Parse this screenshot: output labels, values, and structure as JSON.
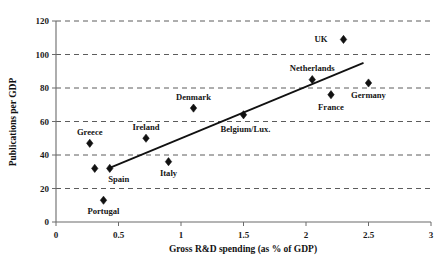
{
  "chart_data": {
    "type": "scatter",
    "title": "",
    "xlabel": "Gross R&D spending (as % of GDP)",
    "ylabel": "Publications per GDP",
    "xlim": [
      0,
      3
    ],
    "ylim": [
      0,
      120
    ],
    "xticks": [
      "0",
      "0.5",
      "1",
      "1.5",
      "2",
      "2.5",
      "3"
    ],
    "xtick_values": [
      0,
      0.5,
      1,
      1.5,
      2,
      2.5,
      3
    ],
    "yticks": [
      "0",
      "20",
      "40",
      "60",
      "80",
      "100",
      "120"
    ],
    "ytick_values": [
      0,
      20,
      40,
      60,
      80,
      100,
      120
    ],
    "grid": "horizontal-dashed",
    "legend": "none",
    "marker_shape": "diamond",
    "marker_color": "#111111",
    "points": [
      {
        "label": "Portugal",
        "x": 0.38,
        "y": 13,
        "label_dx": 0,
        "label_dy": 14,
        "anchor": "middle"
      },
      {
        "label": "Greece",
        "x": 0.27,
        "y": 47,
        "label_dx": 0,
        "label_dy": -8,
        "anchor": "middle"
      },
      {
        "label": "Spain",
        "x": 0.43,
        "y": 32,
        "label_dx": 9,
        "label_dy": 14,
        "anchor": "middle"
      },
      {
        "label": "Ireland",
        "x": 0.72,
        "y": 50,
        "label_dx": 0,
        "label_dy": -8,
        "anchor": "middle"
      },
      {
        "label": "Italy",
        "x": 0.9,
        "y": 36,
        "label_dx": 0,
        "label_dy": 14,
        "anchor": "middle"
      },
      {
        "label": "Denmark",
        "x": 1.1,
        "y": 68,
        "label_dx": 0,
        "label_dy": -8,
        "anchor": "middle"
      },
      {
        "label": "Belgium/Lux.",
        "x": 1.5,
        "y": 64,
        "label_dx": 2,
        "label_dy": 17,
        "anchor": "middle"
      },
      {
        "label": "Netherlands",
        "x": 2.05,
        "y": 85,
        "label_dx": 0,
        "label_dy": -9,
        "anchor": "middle"
      },
      {
        "label": "France",
        "x": 2.2,
        "y": 76,
        "label_dx": 0,
        "label_dy": 15,
        "anchor": "middle"
      },
      {
        "label": "UK",
        "x": 2.3,
        "y": 109,
        "label_dx": -16,
        "label_dy": 3,
        "anchor": "end"
      },
      {
        "label": "Germany",
        "x": 2.5,
        "y": 83,
        "label_dx": 0,
        "label_dy": 15,
        "anchor": "middle"
      }
    ],
    "extra_markers": [
      {
        "x": 0.31,
        "y": 32
      }
    ],
    "trendline": {
      "x_start": 0.42,
      "y_start": 32,
      "x_end": 2.46,
      "y_end": 95
    }
  }
}
